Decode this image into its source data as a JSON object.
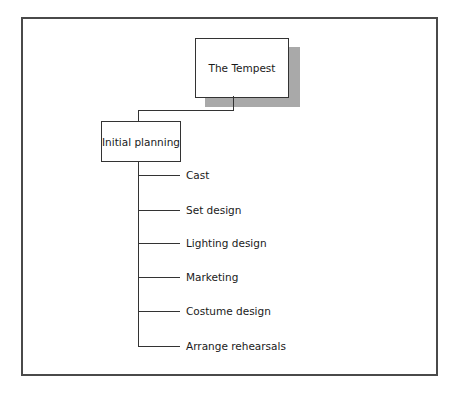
{
  "diagram": {
    "type": "hierarchy",
    "root": {
      "label": "The Tempest"
    },
    "phase": {
      "label": "Initial planning"
    },
    "tasks": [
      {
        "label": "Cast"
      },
      {
        "label": "Set design"
      },
      {
        "label": "Lighting design"
      },
      {
        "label": "Marketing"
      },
      {
        "label": "Costume design"
      },
      {
        "label": "Arrange rehearsals"
      }
    ]
  },
  "colors": {
    "frame": "#4a4a4a",
    "shadow": "#a9a9a9",
    "line": "#333333",
    "background": "#ffffff"
  }
}
